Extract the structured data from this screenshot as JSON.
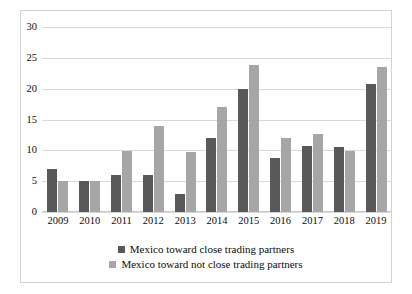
{
  "chart_data": {
    "type": "bar",
    "title": "",
    "xlabel": "",
    "ylabel": "",
    "ylim": [
      0,
      30
    ],
    "yticks": [
      0,
      5,
      10,
      15,
      20,
      25,
      30
    ],
    "grid": true,
    "legend_position": "bottom",
    "categories": [
      "2009",
      "2010",
      "2011",
      "2012",
      "2013",
      "2014",
      "2015",
      "2016",
      "2017",
      "2018",
      "2019"
    ],
    "series": [
      {
        "name": "Mexico toward close trading partners",
        "color": "#595959",
        "values": [
          7,
          5,
          6,
          6,
          3,
          12,
          20,
          8.7,
          10.7,
          10.6,
          20.8
        ]
      },
      {
        "name": "Mexico toward not close trading partners",
        "color": "#a6a6a6",
        "values": [
          5,
          5,
          9.9,
          14,
          9.8,
          17,
          23.8,
          12,
          12.7,
          9.9,
          23.5
        ]
      }
    ]
  }
}
